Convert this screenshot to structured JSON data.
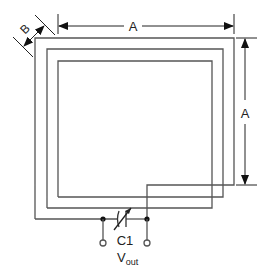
{
  "diagram": {
    "labels": {
      "width_dim": "A",
      "height_dim": "A",
      "spacing_dim": "B",
      "capacitor": "C1",
      "output_main": "V",
      "output_sub": "out"
    },
    "colors": {
      "wire": "#555555",
      "dimension": "#222222",
      "background": "#ffffff"
    },
    "loops": [
      {
        "left": 58,
        "top": 61,
        "right": 212,
        "bottom": 208
      },
      {
        "left": 47,
        "top": 49,
        "right": 223,
        "bottom": 197
      },
      {
        "left": 35,
        "top": 38,
        "right": 234,
        "bottom": 219
      }
    ]
  }
}
